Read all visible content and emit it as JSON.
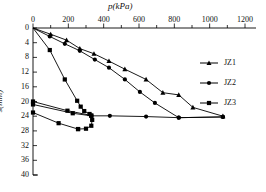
{
  "chart_data": {
    "type": "line",
    "title": "",
    "xlabel": "p(kPa)",
    "ylabel": "s(mm)",
    "xlim": [
      0,
      1300
    ],
    "ylim": [
      0,
      40
    ],
    "y_inverted": true,
    "x_axis_position": "top",
    "grid": false,
    "legend_position": "right",
    "xticks": [
      0,
      200,
      400,
      600,
      800,
      1000,
      1200
    ],
    "xtick_labels": [
      "0",
      "200",
      "400",
      "600",
      "800",
      "1000",
      "1200"
    ],
    "x_minor_tick_step": 100,
    "yticks": [
      0,
      4,
      8,
      12,
      16,
      20,
      24,
      28,
      32,
      36,
      40
    ],
    "ytick_labels": [
      "0",
      "4",
      "8",
      "12",
      "16",
      "20",
      "24",
      "28",
      "32",
      "36",
      "40"
    ],
    "series": [
      {
        "name": "JZ1",
        "marker": "triangle",
        "color": "#000000",
        "points": [
          {
            "p": 0,
            "s": 0.0
          },
          {
            "p": 100,
            "s": 1.7
          },
          {
            "p": 190,
            "s": 3.3
          },
          {
            "p": 265,
            "s": 5.6
          },
          {
            "p": 345,
            "s": 7.0
          },
          {
            "p": 430,
            "s": 9.0
          },
          {
            "p": 520,
            "s": 11.2
          },
          {
            "p": 640,
            "s": 14.0
          },
          {
            "p": 735,
            "s": 17.6
          },
          {
            "p": 825,
            "s": 18.2
          },
          {
            "p": 905,
            "s": 21.6
          },
          {
            "p": 1075,
            "s": 24.0
          }
        ]
      },
      {
        "name": "JZ2",
        "marker": "circle",
        "color": "#000000",
        "points": [
          {
            "p": 0,
            "s": 0.0
          },
          {
            "p": 95,
            "s": 2.3
          },
          {
            "p": 180,
            "s": 4.3
          },
          {
            "p": 265,
            "s": 6.2
          },
          {
            "p": 350,
            "s": 8.6
          },
          {
            "p": 430,
            "s": 10.8
          },
          {
            "p": 520,
            "s": 14.0
          },
          {
            "p": 605,
            "s": 17.4
          },
          {
            "p": 690,
            "s": 20.4
          },
          {
            "p": 825,
            "s": 24.4
          },
          {
            "p": 1075,
            "s": 24.2
          }
        ]
      },
      {
        "name": "JZ3",
        "marker": "square",
        "color": "#000000",
        "points": [
          {
            "p": 0,
            "s": 0.0
          },
          {
            "p": 95,
            "s": 6.0
          },
          {
            "p": 180,
            "s": 14.0
          },
          {
            "p": 250,
            "s": 19.8
          },
          {
            "p": 270,
            "s": 21.4
          },
          {
            "p": 290,
            "s": 22.6
          },
          {
            "p": 320,
            "s": 23.4
          },
          {
            "p": 335,
            "s": 25.0
          },
          {
            "p": 330,
            "s": 26.6
          },
          {
            "p": 300,
            "s": 27.4
          },
          {
            "p": 255,
            "s": 27.5
          }
        ]
      },
      {
        "name": "JZ3-branch-a",
        "marker": "square",
        "color": "#000000",
        "hide_from_legend": true,
        "points": [
          {
            "p": 0,
            "s": 20.0
          },
          {
            "p": 195,
            "s": 22.5
          },
          {
            "p": 330,
            "s": 23.8
          }
        ]
      },
      {
        "name": "JZ3-branch-b",
        "marker": "square",
        "color": "#000000",
        "hide_from_legend": true,
        "points": [
          {
            "p": 0,
            "s": 20.8
          },
          {
            "p": 225,
            "s": 23.2
          },
          {
            "p": 330,
            "s": 23.9
          }
        ]
      },
      {
        "name": "JZ3-branch-c",
        "marker": "square",
        "color": "#000000",
        "hide_from_legend": true,
        "points": [
          {
            "p": 0,
            "s": 23.0
          },
          {
            "p": 145,
            "s": 25.9
          },
          {
            "p": 255,
            "s": 27.5
          }
        ]
      },
      {
        "name": "JZ2-plateau",
        "marker": "circle",
        "color": "#000000",
        "hide_from_legend": true,
        "points": [
          {
            "p": 330,
            "s": 23.9
          },
          {
            "p": 435,
            "s": 23.9
          },
          {
            "p": 640,
            "s": 24.1
          },
          {
            "p": 825,
            "s": 24.4
          },
          {
            "p": 1075,
            "s": 24.2
          }
        ]
      }
    ],
    "legend": [
      {
        "label": "JZ1",
        "marker": "triangle"
      },
      {
        "label": "JZ2",
        "marker": "circle"
      },
      {
        "label": "JZ3",
        "marker": "square"
      }
    ]
  }
}
